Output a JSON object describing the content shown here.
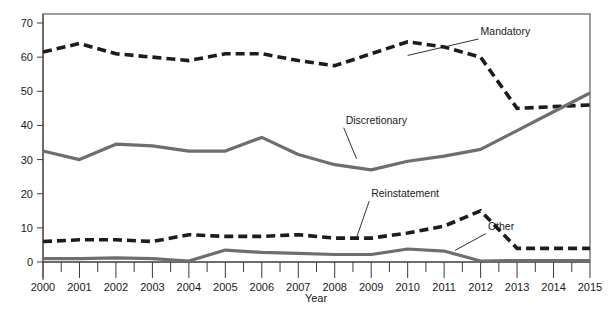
{
  "chart_data": {
    "type": "line",
    "title": "",
    "subtitle": "",
    "xlabel": "Year",
    "ylabel": "",
    "categories": [
      "2000",
      "2001",
      "2002",
      "2003",
      "2004",
      "2005",
      "2006",
      "2007",
      "2008",
      "2009",
      "2010",
      "2011",
      "2012",
      "2013",
      "2014",
      "2015"
    ],
    "x": [
      2000,
      2001,
      2002,
      2003,
      2004,
      2005,
      2006,
      2007,
      2008,
      2009,
      2010,
      2011,
      2012,
      2013,
      2014,
      2015
    ],
    "xlim": [
      2000,
      2015
    ],
    "ylim": [
      0,
      73
    ],
    "yticks": [
      0,
      10,
      20,
      30,
      40,
      50,
      60,
      70
    ],
    "ytick_labels": [
      "0",
      "10",
      "20",
      "30",
      "40",
      "50",
      "60",
      "70"
    ],
    "xtick_labels": [
      "2000",
      "2001",
      "2002",
      "2003",
      "2004",
      "2005",
      "2006",
      "2007",
      "2008",
      "2009",
      "2010",
      "2011",
      "2012",
      "2013",
      "2014",
      "2015"
    ],
    "grid": false,
    "legend": "inline-annotations",
    "series": [
      {
        "name": "Mandatory",
        "style": "dashed",
        "color": "#1c1c1c",
        "label_x": 2012.0,
        "label_y": 66.5,
        "values": [
          61.5,
          64.0,
          61.0,
          60.0,
          59.0,
          61.0,
          61.0,
          59.0,
          57.5,
          61.0,
          64.5,
          63.0,
          60.0,
          45.0,
          45.5,
          46.0
        ]
      },
      {
        "name": "Discretionary",
        "style": "solid",
        "color": "#6e6e6e",
        "label_x": 2008.3,
        "label_y": 40.5,
        "values": [
          32.5,
          30.0,
          34.5,
          34.0,
          32.5,
          32.5,
          36.5,
          31.5,
          28.5,
          27.0,
          29.5,
          31.0,
          33.0,
          38.5,
          44.0,
          49.5
        ]
      },
      {
        "name": "Reinstatement",
        "style": "dashed",
        "color": "#1c1c1c",
        "label_x": 2009.0,
        "label_y": 19.0,
        "values": [
          6.0,
          6.5,
          6.5,
          6.0,
          8.0,
          7.5,
          7.5,
          8.0,
          7.0,
          7.0,
          8.5,
          10.5,
          15.0,
          4.0,
          4.0,
          4.0
        ]
      },
      {
        "name": "Other",
        "style": "solid",
        "color": "#6e6e6e",
        "label_x": 2012.2,
        "label_y": 9.5,
        "values": [
          1.0,
          1.0,
          1.2,
          1.0,
          0.3,
          3.5,
          2.8,
          2.5,
          2.2,
          2.2,
          3.8,
          3.2,
          0.3,
          0.4,
          0.4,
          0.4
        ]
      }
    ],
    "annotations": [
      {
        "text": "Mandatory",
        "target_x": 2010.0,
        "target_y": 60.5
      },
      {
        "text": "Discretionary",
        "target_x": 2008.6,
        "target_y": 30.2
      },
      {
        "text": "Reinstatement",
        "target_x": 2008.6,
        "target_y": 7.2
      },
      {
        "text": "Other",
        "target_x": 2011.3,
        "target_y": 3.4
      }
    ]
  },
  "axes": {
    "x_title": "Year",
    "y_tick_0": "0",
    "y_tick_10": "10",
    "y_tick_20": "20",
    "y_tick_30": "30",
    "y_tick_40": "40",
    "y_tick_50": "50",
    "y_tick_60": "60",
    "y_tick_70": "70",
    "x_tick_2000": "2000",
    "x_tick_2001": "2001",
    "x_tick_2002": "2002",
    "x_tick_2003": "2003",
    "x_tick_2004": "2004",
    "x_tick_2005": "2005",
    "x_tick_2006": "2006",
    "x_tick_2007": "2007",
    "x_tick_2008": "2008",
    "x_tick_2009": "2009",
    "x_tick_2010": "2010",
    "x_tick_2011": "2011",
    "x_tick_2012": "2012",
    "x_tick_2013": "2013",
    "x_tick_2014": "2014",
    "x_tick_2015": "2015"
  },
  "labels": {
    "mandatory": "Mandatory",
    "discretionary": "Discretionary",
    "reinstatement": "Reinstatement",
    "other": "Other"
  },
  "colors": {
    "solid_series": "#6e6e6e",
    "dashed_series": "#1c1c1c",
    "frame": "#3c3c3c",
    "text": "#1a1a1a",
    "background": "#ffffff"
  }
}
